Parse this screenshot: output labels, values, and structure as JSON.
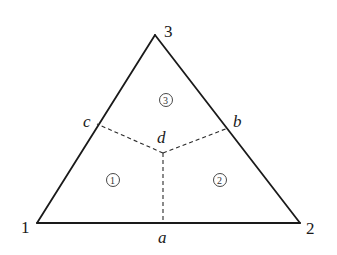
{
  "diagram": {
    "type": "triangle-element-subdivision",
    "colors": {
      "edge": "#1a1a1a",
      "dashed": "#2a2a2a",
      "background": "#ffffff"
    },
    "vertices": [
      {
        "id": "1",
        "label": "1",
        "x": 37,
        "y": 223
      },
      {
        "id": "2",
        "label": "2",
        "x": 300,
        "y": 223
      },
      {
        "id": "3",
        "label": "3",
        "x": 155,
        "y": 35
      }
    ],
    "points": [
      {
        "id": "a",
        "label": "a",
        "description": "midpoint of edge 1-2"
      },
      {
        "id": "b",
        "label": "b",
        "description": "midpoint of edge 2-3"
      },
      {
        "id": "c",
        "label": "c",
        "description": "midpoint of edge 3-1"
      },
      {
        "id": "d",
        "label": "d",
        "description": "interior centroid point"
      }
    ],
    "regions": [
      {
        "id": "1",
        "label": "①"
      },
      {
        "id": "2",
        "label": "②"
      },
      {
        "id": "3",
        "label": "③"
      }
    ],
    "edges_solid": [
      "1-2",
      "2-3",
      "3-1"
    ],
    "edges_dashed": [
      "d-a",
      "d-b",
      "d-c"
    ]
  }
}
